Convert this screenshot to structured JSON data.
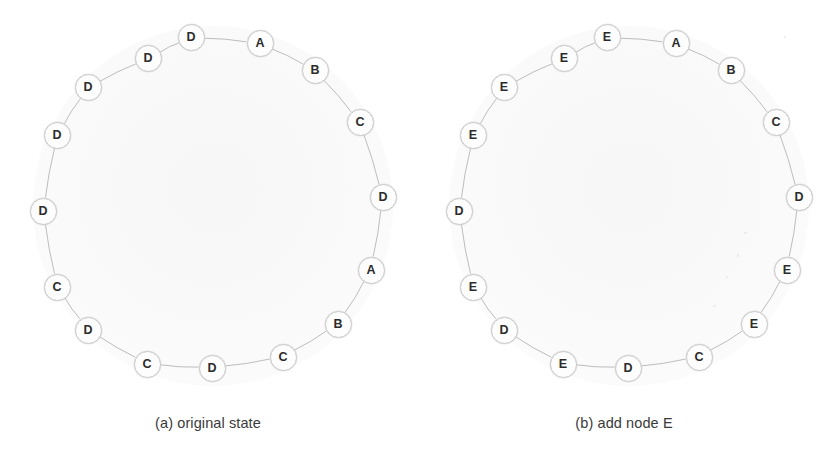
{
  "figure": {
    "type": "diagram",
    "node_count_per_ring": 16,
    "ring_radius_px": 170,
    "node_diameter_px": 27,
    "colors": {
      "background": "#ffffff",
      "node_fill": "#fdfdfd",
      "node_stroke": "#c9c9c9",
      "edge_stroke": "#bdbdbd",
      "label_text": "#2b2b2b",
      "caption_text": "#3a3a3a",
      "interior_tint": "#f7f7f7"
    }
  },
  "panels": [
    {
      "id": "panel-a",
      "caption": "(a) original state",
      "center": {
        "x": 213,
        "y": 206
      },
      "nodes": [
        {
          "label": "D",
          "angle": -97,
          "x": 191,
          "y": 37
        },
        {
          "label": "A",
          "angle": -74,
          "x": 260,
          "y": 43
        },
        {
          "label": "B",
          "angle": -53,
          "x": 315,
          "y": 70
        },
        {
          "label": "C",
          "angle": -30,
          "x": 360,
          "y": 122
        },
        {
          "label": "D",
          "angle": -3,
          "x": 383,
          "y": 197
        },
        {
          "label": "A",
          "angle": 22,
          "x": 371,
          "y": 270
        },
        {
          "label": "B",
          "angle": 44,
          "x": 338,
          "y": 324
        },
        {
          "label": "C",
          "angle": 66,
          "x": 283,
          "y": 357
        },
        {
          "label": "D",
          "angle": 85,
          "x": 212,
          "y": 368
        },
        {
          "label": "C",
          "angle": 104,
          "x": 147,
          "y": 364
        },
        {
          "label": "D",
          "angle": 127,
          "x": 88,
          "y": 330
        },
        {
          "label": "C",
          "angle": 151,
          "x": 57,
          "y": 287
        },
        {
          "label": "D",
          "angle": 178,
          "x": 43,
          "y": 211
        },
        {
          "label": "D",
          "angle": 204,
          "x": 57,
          "y": 135
        },
        {
          "label": "D",
          "angle": 226,
          "x": 88,
          "y": 87
        },
        {
          "label": "D",
          "angle": 250,
          "x": 148,
          "y": 58
        }
      ],
      "sequence": [
        "D",
        "A",
        "B",
        "C",
        "D",
        "A",
        "B",
        "C",
        "D",
        "C",
        "D",
        "C",
        "D",
        "D",
        "D",
        "D"
      ]
    },
    {
      "id": "panel-b",
      "caption": "(b) add node E",
      "center": {
        "x": 213,
        "y": 206
      },
      "nodes": [
        {
          "label": "E",
          "angle": -97,
          "x": 191,
          "y": 37
        },
        {
          "label": "A",
          "angle": -74,
          "x": 260,
          "y": 43
        },
        {
          "label": "B",
          "angle": -53,
          "x": 315,
          "y": 70
        },
        {
          "label": "C",
          "angle": -30,
          "x": 360,
          "y": 122
        },
        {
          "label": "D",
          "angle": -3,
          "x": 383,
          "y": 197
        },
        {
          "label": "E",
          "angle": 22,
          "x": 371,
          "y": 270
        },
        {
          "label": "E",
          "angle": 44,
          "x": 338,
          "y": 324
        },
        {
          "label": "C",
          "angle": 66,
          "x": 283,
          "y": 357
        },
        {
          "label": "D",
          "angle": 85,
          "x": 212,
          "y": 368
        },
        {
          "label": "E",
          "angle": 104,
          "x": 147,
          "y": 364
        },
        {
          "label": "D",
          "angle": 127,
          "x": 88,
          "y": 330
        },
        {
          "label": "E",
          "angle": 151,
          "x": 57,
          "y": 287
        },
        {
          "label": "D",
          "angle": 178,
          "x": 43,
          "y": 211
        },
        {
          "label": "E",
          "angle": 204,
          "x": 57,
          "y": 135
        },
        {
          "label": "E",
          "angle": 226,
          "x": 88,
          "y": 87
        },
        {
          "label": "E",
          "angle": 250,
          "x": 148,
          "y": 58
        }
      ],
      "sequence": [
        "E",
        "A",
        "B",
        "C",
        "D",
        "E",
        "E",
        "C",
        "D",
        "E",
        "D",
        "E",
        "D",
        "E",
        "E",
        "E"
      ]
    }
  ]
}
